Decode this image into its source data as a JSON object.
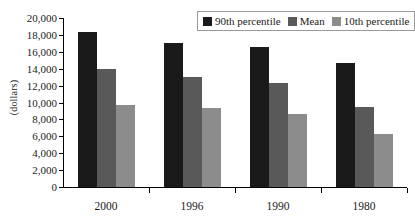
{
  "chart_data": {
    "type": "bar",
    "title": "",
    "subtitle": "",
    "xlabel": "",
    "ylabel": "(dollars)",
    "categories": [
      "2000",
      "1996",
      "1990",
      "1980"
    ],
    "series": [
      {
        "name": "90th percentile",
        "color": "#1a1a1a",
        "values": [
          18400,
          17000,
          16600,
          14700
        ]
      },
      {
        "name": "Mean",
        "color": "#595959",
        "values": [
          14000,
          13000,
          12300,
          9500
        ]
      },
      {
        "name": "10th percentile",
        "color": "#8c8c8c",
        "values": [
          9700,
          9300,
          8600,
          6300
        ]
      }
    ],
    "ylim": [
      0,
      20000
    ],
    "ytick_step": 2000,
    "ytick_labels": [
      "20,000",
      "18,000",
      "16,000",
      "14,000",
      "12,000",
      "10,000",
      "8,000",
      "6,000",
      "4,000",
      "2,000",
      "0"
    ],
    "ytick_values": [
      20000,
      18000,
      16000,
      14000,
      12000,
      10000,
      8000,
      6000,
      4000,
      2000,
      0
    ],
    "grid": false,
    "legend_position": "top-right"
  },
  "axis": {
    "y_title": "(dollars)"
  }
}
